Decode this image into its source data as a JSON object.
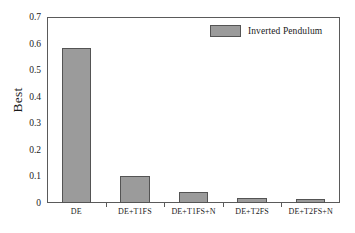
{
  "chart_data": {
    "type": "bar",
    "title": "",
    "xlabel": "",
    "ylabel": "Best",
    "categories": [
      "DE",
      "DE+T1FS",
      "DE+T1FS+N",
      "DE+T2FS",
      "DE+T2FS+N"
    ],
    "values": [
      0.583,
      0.103,
      0.043,
      0.019,
      0.015
    ],
    "series": [
      {
        "name": "Inverted Pendulum",
        "values": [
          0.583,
          0.103,
          0.043,
          0.019,
          0.015
        ]
      }
    ],
    "ylim": [
      0,
      0.7
    ],
    "ytick_labels": [
      "0",
      "0.1",
      "0.2",
      "0.3",
      "0.4",
      "0.5",
      "0.6",
      "0.7"
    ],
    "ytick_values": [
      0,
      0.1,
      0.2,
      0.3,
      0.4,
      0.5,
      0.6,
      0.7
    ],
    "grid": false,
    "legend": {
      "entries": [
        "Inverted Pendulum"
      ],
      "position": "top-right"
    },
    "colors": {
      "bar_fill": "#9b9b9b",
      "bar_edge": "#545454",
      "axis": "#5a5a5a",
      "text": "#1a1a1a",
      "background": "#ffffff"
    }
  }
}
